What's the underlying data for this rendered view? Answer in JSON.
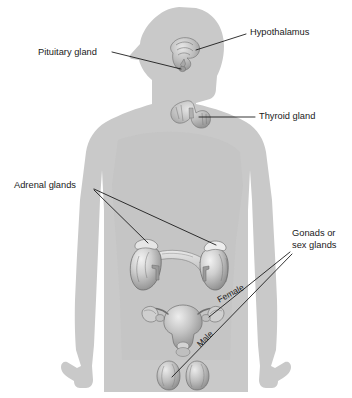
{
  "diagram": {
    "background_color": "#ffffff",
    "body_color": "#c9c9c9",
    "label_color": "#1a1a1a",
    "leader_line_color": "#111111",
    "labels": [
      {
        "id": "hypothalamus",
        "text": "Hypothalamus"
      },
      {
        "id": "pituitary",
        "text": "Pituitary gland"
      },
      {
        "id": "thyroid",
        "text": "Thyroid gland"
      },
      {
        "id": "adrenal",
        "text": "Adrenal glands"
      },
      {
        "id": "gonads_line1",
        "text": "Gonads or"
      },
      {
        "id": "gonads_line2",
        "text": "sex glands"
      },
      {
        "id": "female",
        "text": "Female"
      },
      {
        "id": "male",
        "text": "Male"
      }
    ],
    "structures": [
      {
        "id": "hypothalamus-pituitary-structure",
        "name": "hypothalamus and pituitary gland"
      },
      {
        "id": "thyroid-structure",
        "name": "thyroid gland"
      },
      {
        "id": "kidneys-adrenals-structure",
        "name": "kidneys with adrenal glands and pancreas"
      },
      {
        "id": "uterus-ovaries-structure",
        "name": "uterus with ovaries"
      },
      {
        "id": "testes-structure",
        "name": "testes"
      },
      {
        "id": "human-body-silhouette",
        "name": "human body outline"
      }
    ]
  }
}
